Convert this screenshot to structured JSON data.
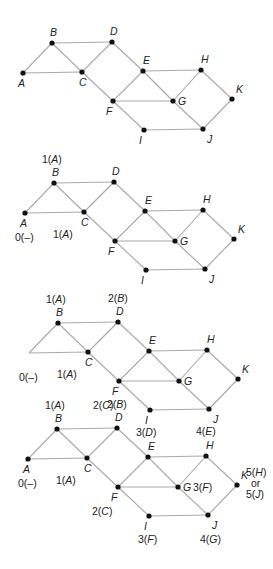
{
  "figure": {
    "node_names": [
      "A",
      "B",
      "C",
      "D",
      "E",
      "F",
      "G",
      "H",
      "I",
      "J",
      "K"
    ],
    "edges": [
      [
        "A",
        "B"
      ],
      [
        "A",
        "C"
      ],
      [
        "B",
        "C"
      ],
      [
        "B",
        "D"
      ],
      [
        "C",
        "D"
      ],
      [
        "C",
        "F"
      ],
      [
        "D",
        "E"
      ],
      [
        "E",
        "F"
      ],
      [
        "E",
        "G"
      ],
      [
        "E",
        "H"
      ],
      [
        "F",
        "G"
      ],
      [
        "F",
        "I"
      ],
      [
        "G",
        "H"
      ],
      [
        "G",
        "J"
      ],
      [
        "H",
        "K"
      ],
      [
        "I",
        "J"
      ],
      [
        "J",
        "K"
      ]
    ],
    "panels": [
      {
        "id": "panel-1",
        "hidden_nodes": [],
        "labels": {}
      },
      {
        "id": "panel-2",
        "hidden_nodes": [],
        "labels": {
          "A": "0(–)",
          "B": "1(A)",
          "C": "1(A)"
        }
      },
      {
        "id": "panel-3",
        "hidden_nodes": [
          "A"
        ],
        "labels": {
          "A": "0(–)",
          "B": "1(A)",
          "C": "1(A)",
          "D": "2(B)",
          "F": "2(C)"
        }
      },
      {
        "id": "panel-4",
        "hidden_nodes": [],
        "labels": {
          "A": "0(–)",
          "B": "1(A)",
          "C": "1(A)",
          "D": "2(B)",
          "E": "3(D)",
          "F": "2(C)",
          "G": "3(F)",
          "H": "4(E)",
          "I": "3(F)",
          "J": "4(G)",
          "K": "5(H) or 5(J)"
        }
      }
    ]
  }
}
